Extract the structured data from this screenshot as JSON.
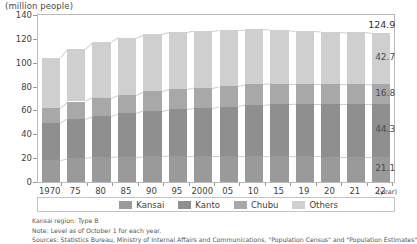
{
  "chart_data": {
    "type": "bar",
    "subtype": "stacked-column",
    "title": "",
    "unit_caption": "(million people)",
    "xlabel": "(year)",
    "ylabel": "",
    "ylim": [
      0,
      140
    ],
    "ytick_step": 20,
    "yticks": [
      "0",
      "20",
      "40",
      "60",
      "80",
      "100",
      "120",
      "140"
    ],
    "grid": false,
    "legend_position": "bottom-right",
    "categories": [
      "1970",
      "75",
      "80",
      "85",
      "90",
      "95",
      "2000",
      "05",
      "10",
      "15",
      "19",
      "20",
      "21",
      "22"
    ],
    "series": [
      {
        "name": "Kansai",
        "color": "#9a9a9a",
        "values": [
          18.7,
          19.8,
          20.6,
          21.0,
          21.5,
          21.9,
          22.0,
          22.0,
          21.9,
          21.7,
          21.4,
          21.3,
          21.2,
          21.1
        ]
      },
      {
        "name": "Kanto",
        "color": "#8f8f8f",
        "values": [
          30.5,
          33.4,
          35.0,
          36.5,
          38.2,
          39.1,
          40.1,
          41.3,
          42.6,
          43.5,
          44.1,
          44.2,
          44.3,
          44.3
        ]
      },
      {
        "name": "Chubu",
        "color": "#a8a8a8",
        "values": [
          13.2,
          14.3,
          15.0,
          15.6,
          16.2,
          16.6,
          16.9,
          17.1,
          17.3,
          17.2,
          17.0,
          16.9,
          16.9,
          16.8
        ]
      },
      {
        "name": "Others",
        "color": "#cfcfcf",
        "values": [
          41.9,
          44.3,
          46.4,
          48.0,
          47.8,
          47.9,
          47.9,
          47.4,
          46.3,
          45.3,
          44.0,
          43.6,
          43.1,
          42.7
        ]
      }
    ],
    "totals": [
      104.3,
      111.8,
      117.0,
      121.1,
      123.7,
      125.5,
      126.9,
      127.8,
      128.1,
      127.7,
      126.5,
      126.0,
      125.5,
      124.9
    ],
    "end_labels": {
      "total": "124.9",
      "others": "42.7",
      "chubu": "16.8",
      "kanto": "44.3",
      "kansai": "21.1"
    }
  },
  "legend": {
    "items": [
      {
        "label": "Kansai",
        "color": "#9a9a9a"
      },
      {
        "label": "Kanto",
        "color": "#8f8f8f"
      },
      {
        "label": "Chubu",
        "color": "#a8a8a8"
      },
      {
        "label": "Others",
        "color": "#cfcfcf"
      }
    ]
  },
  "notes": {
    "line1": "Kansai region: Type B",
    "line2": "Note: Level as of October 1 for each year.",
    "line3": "Sources: Statistics Bureau, Ministry of Internal Affairs and Communications, \"Population Census\" and \"Population Estimates\""
  }
}
